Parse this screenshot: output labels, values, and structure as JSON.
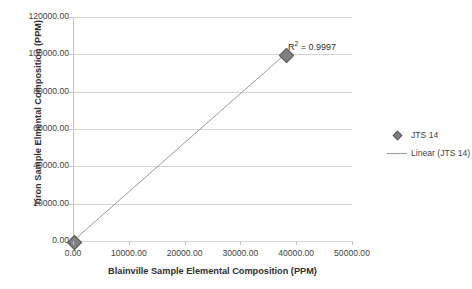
{
  "chart_data": {
    "type": "scatter",
    "title": "",
    "xlabel": "Blainville Sample Elemental Composition (PPM)",
    "ylabel": "Tiron Sample Elmental Composition (PPM)",
    "xlim": [
      0,
      50000
    ],
    "ylim": [
      0,
      120000
    ],
    "grid": "horizontal",
    "legend_position": "right",
    "xticks": [
      "0.00",
      "10000.00",
      "20000.00",
      "30000.00",
      "40000.00",
      "50000.00"
    ],
    "xtick_values": [
      0,
      10000,
      20000,
      30000,
      40000,
      50000
    ],
    "yticks": [
      "0.00",
      "20000.00",
      "40000.00",
      "60000.00",
      "80000.00",
      "100000.00",
      "120000.00"
    ],
    "ytick_values": [
      0,
      20000,
      40000,
      60000,
      80000,
      100000,
      120000
    ],
    "series": [
      {
        "name": "JTS 14",
        "kind": "scatter",
        "marker": "diamond",
        "color": "#808080",
        "points": [
          {
            "x": 0,
            "y": 0
          },
          {
            "x": 38000,
            "y": 100000
          }
        ]
      },
      {
        "name": "Linear (JTS 14)",
        "kind": "trendline",
        "color": "#9a9a9a",
        "points": [
          {
            "x": 0,
            "y": 0
          },
          {
            "x": 38000,
            "y": 100000
          }
        ]
      }
    ],
    "annotations": [
      {
        "name": "r-squared",
        "prefix": "R",
        "superscript": "2",
        "text": " = 0.9997",
        "value": 0.9997,
        "x": 38000,
        "y": 100000
      }
    ],
    "legend": [
      {
        "label": "JTS 14",
        "key": "diamond-marker"
      },
      {
        "label": "Linear (JTS 14)",
        "key": "line-marker"
      }
    ]
  },
  "colors": {
    "marker": "#808080",
    "marker_edge": "#5a5a5a",
    "trendline": "#9a9a9a",
    "gridline": "#d4d4d4",
    "axis": "#c4c4c4",
    "text": "#3f3f3f",
    "background": "#ffffff"
  }
}
